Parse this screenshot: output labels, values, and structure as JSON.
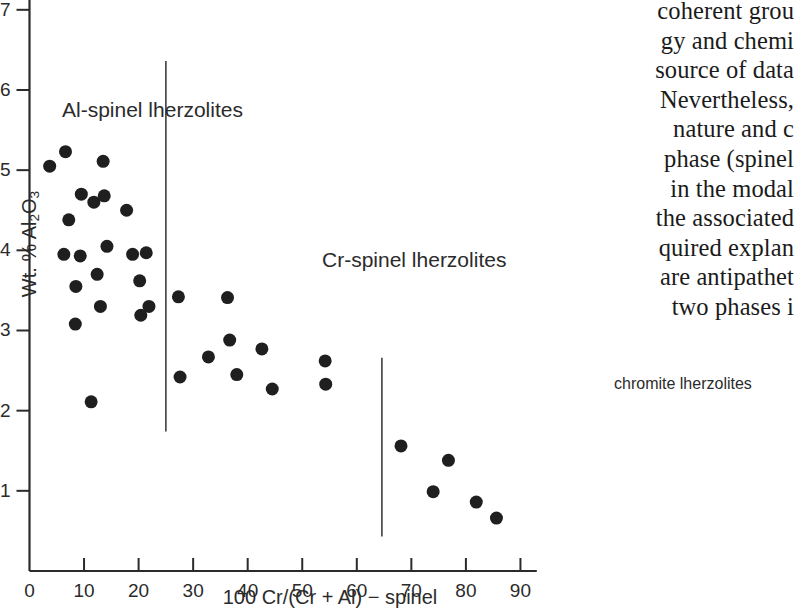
{
  "figure": {
    "axes": {
      "x": {
        "title": "100 Cr/(Cr + Al) − spinel",
        "ticks": [
          0,
          10,
          20,
          30,
          40,
          50,
          60,
          70,
          80,
          90
        ],
        "tick_labels": [
          "0",
          "10",
          "20",
          "30",
          "40",
          "50",
          "60",
          "70",
          "80",
          "90"
        ],
        "range": [
          0,
          93
        ]
      },
      "y": {
        "title_plain": "Wt. % Al2O3",
        "title_prefix": "Wt. % Al",
        "title_sub1": "2",
        "title_mid": "O",
        "title_sub2": "3",
        "ticks": [
          1,
          2,
          3,
          4,
          5,
          6,
          7
        ],
        "tick_labels": [
          "1",
          "2",
          "3",
          "4",
          "5",
          "6",
          "7"
        ],
        "range": [
          0,
          7.13
        ]
      }
    },
    "annotations": {
      "al_spinel": "Al-spinel lherzolites",
      "cr_spinel": "Cr-spinel lherzolites",
      "chromite": "chromite lherzolites"
    },
    "dividers": [
      {
        "name": "al-cr-divider",
        "x": 25.0,
        "y_top": 6.36,
        "y_bottom": 1.74
      },
      {
        "name": "cr-chromite-divider",
        "x": 64.6,
        "y_top": 2.66,
        "y_bottom": 0.43
      }
    ]
  },
  "chart_data": {
    "type": "scatter",
    "title": "",
    "xlabel": "100 Cr/(Cr + Al) − spinel",
    "ylabel": "Wt. % Al2O3",
    "xlim": [
      0,
      93
    ],
    "ylim": [
      0,
      7.13
    ],
    "grid": false,
    "legend": "none",
    "marker": {
      "shape": "circle",
      "color": "#1f1f1f",
      "size_px": 13
    },
    "series": [
      {
        "name": "Al-spinel lherzolites",
        "points": [
          [
            3.7,
            5.05
          ],
          [
            6.6,
            5.23
          ],
          [
            6.3,
            3.95
          ],
          [
            7.2,
            4.38
          ],
          [
            8.5,
            3.55
          ],
          [
            8.4,
            3.08
          ],
          [
            9.5,
            4.7
          ],
          [
            9.3,
            3.93
          ],
          [
            11.3,
            2.11
          ],
          [
            11.8,
            4.6
          ],
          [
            12.4,
            3.7
          ],
          [
            13.0,
            3.3
          ],
          [
            13.5,
            5.11
          ],
          [
            13.7,
            4.68
          ],
          [
            14.2,
            4.05
          ],
          [
            17.8,
            4.5
          ],
          [
            18.9,
            3.95
          ],
          [
            20.2,
            3.62
          ],
          [
            20.4,
            3.19
          ],
          [
            21.4,
            3.97
          ],
          [
            21.9,
            3.3
          ]
        ]
      },
      {
        "name": "Cr-spinel lherzolites",
        "points": [
          [
            27.3,
            3.42
          ],
          [
            27.6,
            2.42
          ],
          [
            32.8,
            2.67
          ],
          [
            36.3,
            3.41
          ],
          [
            36.7,
            2.88
          ],
          [
            38.0,
            2.45
          ],
          [
            42.6,
            2.77
          ],
          [
            44.5,
            2.27
          ],
          [
            54.2,
            2.62
          ],
          [
            54.3,
            2.33
          ]
        ]
      },
      {
        "name": "chromite lherzolites",
        "points": [
          [
            68.1,
            1.56
          ],
          [
            74.0,
            0.99
          ],
          [
            76.8,
            1.38
          ],
          [
            81.9,
            0.86
          ],
          [
            85.6,
            0.66
          ]
        ]
      }
    ]
  },
  "body_text": {
    "lines": [
      "coherent grou",
      "gy and chemi",
      "source of data",
      "Nevertheless,",
      "nature and c",
      "phase (spinel ",
      "in the modal ",
      "the associated",
      "quired explan",
      "are antipathet",
      "two phases i"
    ]
  }
}
